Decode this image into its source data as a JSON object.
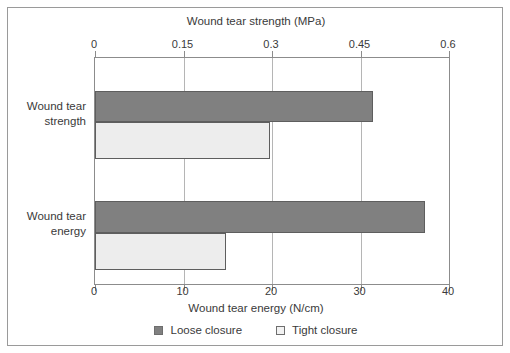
{
  "chart_data": {
    "type": "bar",
    "orientation": "horizontal",
    "title": "",
    "categories": [
      "Wound tear\nstrength",
      "Wound tear\nenergy"
    ],
    "series": [
      {
        "name": "Loose closure",
        "color": "#808080",
        "values": [
          0.47,
          37.0
        ]
      },
      {
        "name": "Tight closure",
        "color": "#ededed",
        "values": [
          0.3,
          14.8
        ]
      }
    ],
    "top_axis": {
      "label": "Wound tear strength (MPa)",
      "ticks": [
        "0",
        "0.15",
        "0.3",
        "0.45",
        "0.6"
      ],
      "tick_values": [
        0,
        0.15,
        0.3,
        0.45,
        0.6
      ],
      "range": [
        0,
        0.6
      ],
      "applies_to_category": "Wound tear strength"
    },
    "bottom_axis": {
      "label": "Wound tear energy (N/cm)",
      "ticks": [
        "0",
        "10",
        "20",
        "30",
        "40"
      ],
      "tick_values": [
        0,
        10,
        20,
        30,
        40
      ],
      "range": [
        0,
        40
      ],
      "applies_to_category": "Wound tear energy"
    },
    "grid": true,
    "legend_position": "bottom",
    "legend": [
      "Loose closure",
      "Tight closure"
    ]
  },
  "bars": [
    {
      "group": 0,
      "series": "Loose closure",
      "axis": "top",
      "value": 0.47,
      "frac": 0.785
    },
    {
      "group": 0,
      "series": "Tight closure",
      "axis": "top",
      "value": 0.3,
      "frac": 0.494
    },
    {
      "group": 1,
      "series": "Loose closure",
      "axis": "bottom",
      "value": 37.0,
      "frac": 0.932
    },
    {
      "group": 1,
      "series": "Tight closure",
      "axis": "bottom",
      "value": 14.8,
      "frac": 0.37
    }
  ],
  "category_labels": [
    "Wound tear\nstrength",
    "Wound tear\nenergy"
  ]
}
